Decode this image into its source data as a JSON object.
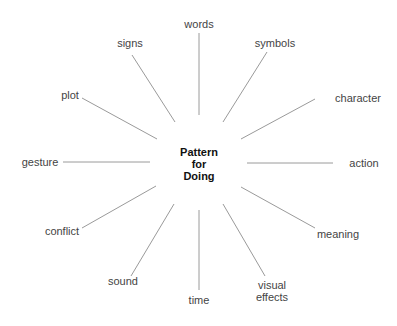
{
  "diagram": {
    "type": "spider-diagram",
    "center": {
      "lines": [
        "Pattern",
        "for",
        "Doing"
      ]
    },
    "branches": [
      {
        "id": "words",
        "label_lines": [
          "words"
        ]
      },
      {
        "id": "symbols",
        "label_lines": [
          "symbols"
        ]
      },
      {
        "id": "character",
        "label_lines": [
          "character"
        ]
      },
      {
        "id": "action",
        "label_lines": [
          "action"
        ]
      },
      {
        "id": "meaning",
        "label_lines": [
          "meaning"
        ]
      },
      {
        "id": "visual-effects",
        "label_lines": [
          "visual",
          "effects"
        ]
      },
      {
        "id": "time",
        "label_lines": [
          "time"
        ]
      },
      {
        "id": "sound",
        "label_lines": [
          "sound"
        ]
      },
      {
        "id": "conflict",
        "label_lines": [
          "conflict"
        ]
      },
      {
        "id": "gesture",
        "label_lines": [
          "gesture"
        ]
      },
      {
        "id": "plot",
        "label_lines": [
          "plot"
        ]
      },
      {
        "id": "signs",
        "label_lines": [
          "signs"
        ]
      }
    ],
    "colors": {
      "line": "#9a9a9a",
      "label": "#444444",
      "center": "#111111",
      "background": "#ffffff"
    }
  }
}
